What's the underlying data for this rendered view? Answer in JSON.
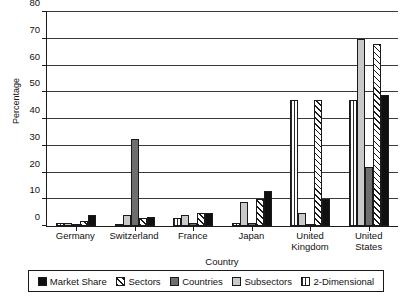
{
  "chart_data": {
    "type": "bar",
    "title": "",
    "xlabel": "Country",
    "ylabel": "Percentage",
    "ylim": [
      0,
      80
    ],
    "yticks": [
      0,
      10,
      20,
      30,
      40,
      50,
      60,
      70,
      80
    ],
    "grid": true,
    "legend_position": "bottom",
    "categories": [
      "Germany",
      "Switzerland",
      "France",
      "Japan",
      "United Kingdom",
      "United States"
    ],
    "series": [
      {
        "name": "2-Dimensional",
        "pattern": "vertical-lines",
        "color": "#ffffff",
        "values": [
          1,
          0.5,
          3,
          1,
          47,
          47
        ]
      },
      {
        "name": "Subsectors",
        "pattern": "solid",
        "color": "#c9c9c9",
        "values": [
          1,
          4,
          4,
          9,
          5,
          70
        ]
      },
      {
        "name": "Countries",
        "pattern": "solid",
        "color": "#6e6e6e",
        "values": [
          0.5,
          32.5,
          1,
          1,
          0.5,
          22
        ]
      },
      {
        "name": "Sectors",
        "pattern": "diagonal-hatch",
        "color": "#ffffff",
        "values": [
          2,
          3,
          5,
          10,
          47,
          68
        ]
      },
      {
        "name": "Market Share",
        "pattern": "solid",
        "color": "#101010",
        "values": [
          4,
          3.5,
          5,
          13,
          10,
          49
        ]
      }
    ],
    "legend_order": [
      "Market Share",
      "Sectors",
      "Countries",
      "Subsectors",
      "2-Dimensional"
    ]
  }
}
